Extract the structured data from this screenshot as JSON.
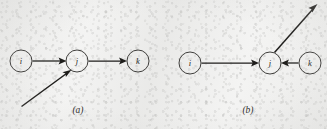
{
  "figure": {
    "background_color": "#f3f3f2",
    "ink_color": "#1e1d1b",
    "panels": [
      {
        "caption": "(a)",
        "caption_x": 78,
        "caption_y": 113,
        "nodes": [
          {
            "id": "i",
            "label": "i",
            "cx": 21,
            "cy": 61,
            "r": 11
          },
          {
            "id": "j",
            "label": "j",
            "cx": 77,
            "cy": 61,
            "r": 11
          },
          {
            "id": "k",
            "label": "k",
            "cx": 138,
            "cy": 61,
            "r": 11
          }
        ],
        "edges": [
          {
            "name": "edge-i-to-j",
            "from": "i",
            "to": "j",
            "direction": "right",
            "arrow": true
          },
          {
            "name": "edge-j-to-k",
            "from": "j",
            "to": "k",
            "direction": "right",
            "arrow": true
          },
          {
            "name": "edge-external-to-j",
            "from": "external-lower-left",
            "to": "j",
            "direction": "up-right",
            "arrow": true
          }
        ]
      },
      {
        "caption": "(b)",
        "caption_x": 246,
        "caption_y": 113,
        "nodes": [
          {
            "id": "i",
            "label": "i",
            "cx": 190,
            "cy": 63,
            "r": 11
          },
          {
            "id": "j",
            "label": "j",
            "cx": 270,
            "cy": 63,
            "r": 11
          },
          {
            "id": "k",
            "label": "k",
            "cx": 310,
            "cy": 63,
            "r": 11
          }
        ],
        "edges": [
          {
            "name": "edge-i-to-j",
            "from": "i",
            "to": "j",
            "direction": "right",
            "arrow": true
          },
          {
            "name": "edge-k-to-j",
            "from": "k",
            "to": "j",
            "direction": "left",
            "arrow": true
          },
          {
            "name": "edge-j-to-external",
            "from": "j",
            "to": "external-upper-right",
            "direction": "up-right",
            "arrow": true
          }
        ]
      }
    ]
  }
}
